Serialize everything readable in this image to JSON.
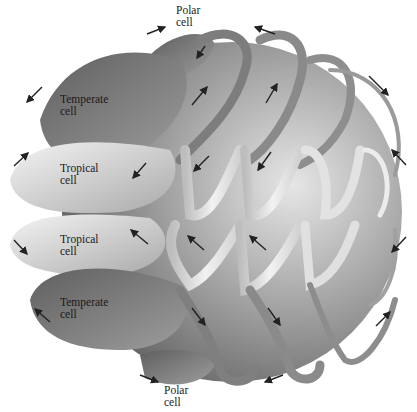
{
  "diagram": {
    "title": "",
    "labels": [
      {
        "id": "polar-top",
        "line1": "Polar",
        "line2": "cell"
      },
      {
        "id": "temperate-north",
        "line1": "Temperate",
        "line2": "cell"
      },
      {
        "id": "tropical-north",
        "line1": "Tropical",
        "line2": "cell"
      },
      {
        "id": "tropical-south",
        "line1": "Tropical",
        "line2": "cell"
      },
      {
        "id": "temperate-south",
        "line1": "Temperate",
        "line2": "cell"
      },
      {
        "id": "polar-bottom",
        "line1": "Polar",
        "line2": "cell"
      }
    ],
    "bands": [
      {
        "name": "polar-north",
        "shade": "#6e6e6e"
      },
      {
        "name": "temperate-north",
        "shade": "#8a8a8a"
      },
      {
        "name": "tropical-north",
        "shade": "#e4e4e4"
      },
      {
        "name": "tropical-south",
        "shade": "#e4e4e4"
      },
      {
        "name": "temperate-south",
        "shade": "#8a8a8a"
      },
      {
        "name": "polar-south",
        "shade": "#6e6e6e"
      }
    ],
    "colors": {
      "globe_light": "#d6d6d6",
      "globe_dark": "#6a6a6a",
      "arrow": "#222222"
    }
  }
}
